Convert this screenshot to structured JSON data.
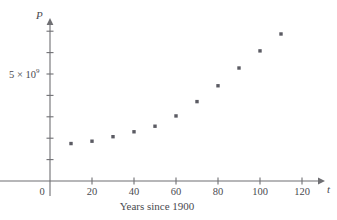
{
  "chart_data": {
    "type": "scatter",
    "title": "",
    "xlabel": "Years since 1900",
    "ylabel": "P",
    "x_axis_name": "t",
    "y_axis_name": "P",
    "origin_label": "0",
    "xlim": [
      0,
      130
    ],
    "ylim": [
      0,
      8200000000
    ],
    "xticks": [
      20,
      40,
      60,
      80,
      100,
      120
    ],
    "xtick_labels": [
      "20",
      "40",
      "60",
      "80",
      "100",
      "120"
    ],
    "yticks": [
      1000000000,
      2000000000,
      3000000000,
      4000000000,
      5000000000,
      6000000000,
      7000000000
    ],
    "ytick_labels": [
      "",
      "",
      "",
      "",
      "5 × 10⁹",
      "",
      ""
    ],
    "y_label_value": 5000000000,
    "y_label_mantissa": "5 × 10",
    "y_label_exponent": "9",
    "grid": false,
    "legend": false,
    "x": [
      10,
      20,
      30,
      40,
      50,
      60,
      70,
      80,
      90,
      100,
      110
    ],
    "values": [
      1750000000,
      1860000000,
      2070000000,
      2300000000,
      2560000000,
      3040000000,
      3710000000,
      4450000000,
      5280000000,
      6080000000,
      6870000000
    ],
    "point_count": 11,
    "point_color": "#5b5b63",
    "axis_color": "#6f6f73"
  },
  "labels": {
    "caption": "Years since 1900",
    "origin": "0",
    "x_axis": "t",
    "y_axis": "P",
    "y_tick_main": "5 × 10",
    "y_tick_exp": "9",
    "xticks": [
      "20",
      "40",
      "60",
      "80",
      "100",
      "120"
    ]
  }
}
